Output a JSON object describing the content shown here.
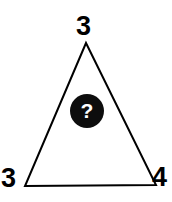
{
  "figure": {
    "type": "triangle-number-puzzle",
    "background_color": "#ffffff",
    "stroke_color": "#000000",
    "stroke_width": 2,
    "shape_name": "triangle",
    "vertices": [
      {
        "id": "apex",
        "position": "top",
        "x": 86,
        "y": 43
      },
      {
        "id": "left",
        "position": "bottom-left",
        "x": 25,
        "y": 186
      },
      {
        "id": "right",
        "position": "bottom-right",
        "x": 156,
        "y": 185
      }
    ],
    "labels": {
      "top": "3",
      "bottom_left": "3",
      "bottom_right": "4"
    },
    "center_marker": {
      "glyph": "?",
      "shape": "circle",
      "fill_color": "#0d0d0d",
      "glyph_color": "#ffffff",
      "center_x": 87,
      "center_y": 111,
      "radius": 17
    }
  }
}
